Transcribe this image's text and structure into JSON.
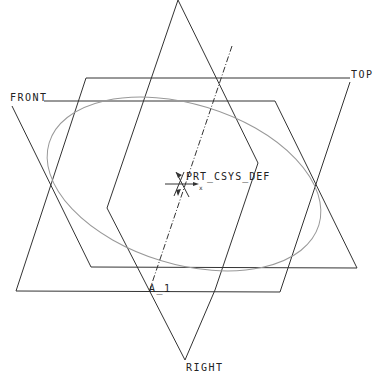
{
  "viewport": {
    "background": "#ffffff",
    "line_color": "#333333",
    "curve_color": "#999999"
  },
  "datums": {
    "planes": [
      {
        "name": "TOP",
        "label": "TOP"
      },
      {
        "name": "FRONT",
        "label": "FRONT"
      },
      {
        "name": "RIGHT",
        "label": "RIGHT"
      }
    ],
    "axis": {
      "label": "A_1"
    },
    "csys": {
      "label": "PRT_CSYS_DEF",
      "x_label": "x"
    }
  },
  "labels": {
    "top": "TOP",
    "front": "FRONT",
    "right": "RIGHT",
    "axis": "A_1",
    "csys": "PRT_CSYS_DEF",
    "csys_x": "x"
  }
}
